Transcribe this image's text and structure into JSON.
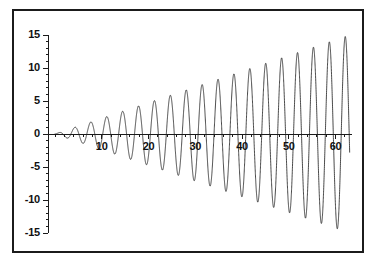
{
  "chart_data": {
    "type": "line",
    "title": "",
    "xlabel": "",
    "ylabel": "",
    "xlim": [
      -1.5,
      63.5
    ],
    "ylim": [
      -16.5,
      16.5
    ],
    "grid": false,
    "legend": "none",
    "x_ticks": [
      10,
      20,
      30,
      40,
      50,
      60
    ],
    "x_tick_labels": [
      "10",
      "20",
      "30",
      "40",
      "50",
      "60"
    ],
    "x_minor_tick_step": 2,
    "y_ticks": [
      15,
      10,
      5,
      0,
      -5,
      -10,
      -15
    ],
    "y_tick_labels": [
      "15",
      "10",
      "5",
      "0",
      "-5",
      "-10",
      "-15"
    ],
    "y_minor_tick_step": 1,
    "line_color": "#1b1b1b",
    "line_width": 0.8,
    "series": [
      {
        "name": "growing-oscillation",
        "amplitude_slope": 0.238,
        "period": 3.4,
        "phase": 0,
        "x_start": 0,
        "x_end": 63
      }
    ],
    "peaks": [
      {
        "x": 1.7,
        "y": 0.4
      },
      {
        "x": 5.1,
        "y": 1.2
      },
      {
        "x": 8.5,
        "y": 2.0
      },
      {
        "x": 11.9,
        "y": 2.8
      },
      {
        "x": 15.3,
        "y": 3.6
      },
      {
        "x": 18.7,
        "y": 4.5
      },
      {
        "x": 22.1,
        "y": 5.3
      },
      {
        "x": 25.5,
        "y": 6.1
      },
      {
        "x": 28.9,
        "y": 6.9
      },
      {
        "x": 32.3,
        "y": 7.7
      },
      {
        "x": 35.7,
        "y": 8.5
      },
      {
        "x": 39.1,
        "y": 9.3
      },
      {
        "x": 42.5,
        "y": 10.1
      },
      {
        "x": 45.9,
        "y": 10.9
      },
      {
        "x": 49.3,
        "y": 11.7
      },
      {
        "x": 52.7,
        "y": 12.5
      },
      {
        "x": 56.1,
        "y": 13.4
      },
      {
        "x": 59.5,
        "y": 14.2
      },
      {
        "x": 62.9,
        "y": 15.0
      }
    ],
    "troughs": [
      {
        "x": 3.4,
        "y": -0.8
      },
      {
        "x": 6.8,
        "y": -1.6
      },
      {
        "x": 10.2,
        "y": -2.4
      },
      {
        "x": 13.6,
        "y": -3.2
      },
      {
        "x": 17.0,
        "y": -4.0
      },
      {
        "x": 20.4,
        "y": -4.9
      },
      {
        "x": 23.8,
        "y": -5.7
      },
      {
        "x": 27.2,
        "y": -6.5
      },
      {
        "x": 30.6,
        "y": -7.3
      },
      {
        "x": 34.0,
        "y": -8.1
      },
      {
        "x": 37.4,
        "y": -8.9
      },
      {
        "x": 40.8,
        "y": -9.7
      },
      {
        "x": 44.2,
        "y": -10.5
      },
      {
        "x": 47.6,
        "y": -11.3
      },
      {
        "x": 51.0,
        "y": -12.1
      },
      {
        "x": 54.4,
        "y": -12.9
      },
      {
        "x": 57.8,
        "y": -13.8
      },
      {
        "x": 61.2,
        "y": -14.6
      }
    ]
  }
}
